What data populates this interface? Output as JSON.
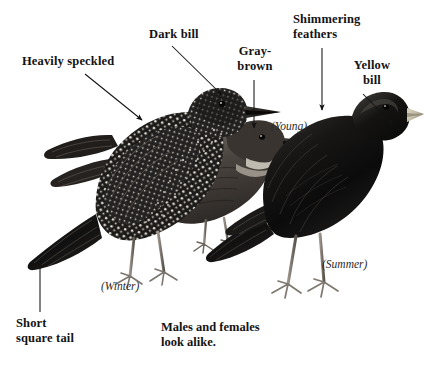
{
  "plate": {
    "title": "European Starling identification plate",
    "background_color": "#ffffff",
    "ink_color": "#131313"
  },
  "labels": [
    {
      "id": "heavily-speckled",
      "text": "Heavily speckled",
      "style": "bold",
      "x": 22,
      "y": 54,
      "arrow": {
        "x1": 85,
        "y1": 74,
        "x2": 142,
        "y2": 120
      }
    },
    {
      "id": "dark-bill",
      "text": "Dark bill",
      "style": "bold",
      "x": 149,
      "y": 27,
      "arrow": {
        "x1": 172,
        "y1": 46,
        "x2": 222,
        "y2": 95
      }
    },
    {
      "id": "gray-brown",
      "text": "Gray-\nbrown",
      "style": "bold",
      "x": 233,
      "y": 44,
      "arrow": {
        "x1": 254,
        "y1": 80,
        "x2": 254,
        "y2": 128
      }
    },
    {
      "id": "shimmering-feathers",
      "text": "Shimmering\nfeathers",
      "style": "bold",
      "x": 293,
      "y": 12,
      "arrow": {
        "x1": 322,
        "y1": 48,
        "x2": 322,
        "y2": 110
      }
    },
    {
      "id": "yellow-bill",
      "text": "Yellow\nbill",
      "style": "bold",
      "x": 352,
      "y": 58,
      "arrow": {
        "x1": 363,
        "y1": 94,
        "x2": 393,
        "y2": 124
      }
    },
    {
      "id": "short-square-tail",
      "text": "Short\nsquare tail",
      "style": "bold",
      "x": 16,
      "y": 316,
      "arrow": {
        "x1": 40,
        "y1": 312,
        "x2": 40,
        "y2": 261
      }
    }
  ],
  "captions": [
    {
      "id": "young",
      "text": "(Young)",
      "x": 271,
      "y": 120
    },
    {
      "id": "winter",
      "text": "(Winter)",
      "x": 101,
      "y": 280
    },
    {
      "id": "summer",
      "text": "(Summer)",
      "x": 322,
      "y": 258
    }
  ],
  "note": {
    "id": "males-females-note",
    "text": "Males and females\nlook alike.",
    "x": 161,
    "y": 320
  },
  "birds": [
    {
      "id": "winter-starling",
      "season": "Winter",
      "plumage": "heavily speckled",
      "bill": "dark"
    },
    {
      "id": "young-starling",
      "season": "Young",
      "plumage": "gray-brown",
      "bill": "dark"
    },
    {
      "id": "summer-starling",
      "season": "Summer",
      "plumage": "glossy iridescent",
      "bill": "yellow"
    }
  ]
}
